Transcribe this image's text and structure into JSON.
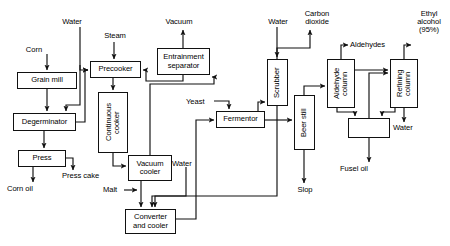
{
  "diagram": {
    "type": "process-flow-diagram",
    "canvas": {
      "width": 450,
      "height": 246
    },
    "colors": {
      "line": "#111111",
      "background": "#ffffff",
      "text": "#000000"
    }
  },
  "units": [
    {
      "id": "grain-mill",
      "label": "Grain mill",
      "orientation": "horizontal",
      "x": 17,
      "y": 72,
      "w": 60,
      "h": 17
    },
    {
      "id": "degerminator",
      "label": "Degerminator",
      "orientation": "horizontal",
      "x": 13,
      "y": 113,
      "w": 63,
      "h": 18
    },
    {
      "id": "press",
      "label": "Press",
      "orientation": "horizontal",
      "x": 18,
      "y": 150,
      "w": 48,
      "h": 17
    },
    {
      "id": "precooker",
      "label": "Precooker",
      "orientation": "horizontal",
      "x": 90,
      "y": 61,
      "w": 51,
      "h": 17
    },
    {
      "id": "continuous-cooker",
      "label": "Continuous\ncooker",
      "orientation": "vertical",
      "x": 98,
      "y": 92,
      "w": 30,
      "h": 61
    },
    {
      "id": "vacuum-cooler",
      "label": "Vacuum\ncooler",
      "orientation": "horizontal",
      "x": 128,
      "y": 155,
      "w": 44,
      "h": 26
    },
    {
      "id": "converter-and-cooler",
      "label": "Converter\nand cooler",
      "orientation": "horizontal",
      "x": 125,
      "y": 209,
      "w": 51,
      "h": 25
    },
    {
      "id": "entrainment-separator",
      "label": "Entrainment\nseparator",
      "orientation": "horizontal",
      "x": 157,
      "y": 48,
      "w": 53,
      "h": 27
    },
    {
      "id": "fermentor",
      "label": "Fermentor",
      "orientation": "horizontal",
      "x": 216,
      "y": 111,
      "w": 49,
      "h": 17
    },
    {
      "id": "scrubber",
      "label": "Scrubber",
      "orientation": "vertical",
      "x": 267,
      "y": 59,
      "w": 21,
      "h": 47
    },
    {
      "id": "beer-still",
      "label": "Beer still",
      "orientation": "vertical",
      "x": 294,
      "y": 95,
      "w": 21,
      "h": 55
    },
    {
      "id": "aldehyde-column",
      "label": "Aldehyde\ncolumn",
      "orientation": "vertical",
      "x": 327,
      "y": 59,
      "w": 28,
      "h": 49
    },
    {
      "id": "refining-column",
      "label": "Refining\ncolumn",
      "orientation": "vertical",
      "x": 390,
      "y": 59,
      "w": 28,
      "h": 49
    },
    {
      "id": "decanter",
      "label": "",
      "orientation": "horizontal",
      "x": 348,
      "y": 118,
      "w": 42,
      "h": 20
    }
  ],
  "stream_labels": [
    {
      "id": "corn",
      "text": "Corn",
      "x": 18,
      "y": 46,
      "align": "ctr",
      "w": 32
    },
    {
      "id": "water-top-left",
      "text": "Water",
      "x": 54,
      "y": 18,
      "align": "ctr",
      "w": 36
    },
    {
      "id": "steam",
      "text": "Steam",
      "x": 96,
      "y": 32,
      "align": "ctr",
      "w": 38
    },
    {
      "id": "press-cake",
      "text": "Press cake",
      "x": 62,
      "y": 172,
      "align": "lft",
      "w": 54
    },
    {
      "id": "corn-oil",
      "text": "Corn oil",
      "x": 7,
      "y": 185,
      "align": "lft",
      "w": 44
    },
    {
      "id": "vacuum",
      "text": "Vacuum",
      "x": 156,
      "y": 18,
      "align": "ctr",
      "w": 46
    },
    {
      "id": "yeast",
      "text": "Yeast",
      "x": 186,
      "y": 98,
      "align": "lft",
      "w": 30
    },
    {
      "id": "malt",
      "text": "Malt",
      "x": 103,
      "y": 186,
      "align": "lft",
      "w": 26
    },
    {
      "id": "water-mid",
      "text": "Water",
      "x": 172,
      "y": 160,
      "align": "lft",
      "w": 34
    },
    {
      "id": "water-scrubber",
      "text": "Water",
      "x": 261,
      "y": 18,
      "align": "ctr",
      "w": 34
    },
    {
      "id": "carbon-dioxide",
      "text": "Carbon\ndioxide",
      "x": 296,
      "y": 10,
      "align": "ctr",
      "w": 42
    },
    {
      "id": "slop",
      "text": "Slop",
      "x": 293,
      "y": 186,
      "align": "ctr",
      "w": 24
    },
    {
      "id": "aldehydes",
      "text": "Aldehydes",
      "x": 350,
      "y": 41,
      "align": "lft",
      "w": 52
    },
    {
      "id": "ethyl-alcohol",
      "text": "Ethyl\nalcohol\n(95%)",
      "x": 409,
      "y": 10,
      "align": "ctr",
      "w": 40
    },
    {
      "id": "water-refining",
      "text": "Water",
      "x": 393,
      "y": 124,
      "align": "lft",
      "w": 34
    },
    {
      "id": "fusel-oil",
      "text": "Fusel oil",
      "x": 340,
      "y": 165,
      "align": "lft",
      "w": 42
    }
  ],
  "connections": [
    {
      "id": "corn-to-grain-mill",
      "from": "corn",
      "to": "grain-mill"
    },
    {
      "id": "grain-mill-to-degerminator",
      "from": "grain-mill",
      "to": "degerminator"
    },
    {
      "id": "water-to-degerminator",
      "from": "water-top-left",
      "to": "degerminator"
    },
    {
      "id": "water-to-precooker",
      "from": "water-top-left",
      "to": "precooker"
    },
    {
      "id": "degerminator-to-press",
      "from": "degerminator",
      "to": "press"
    },
    {
      "id": "degerminator-to-precooker",
      "from": "degerminator",
      "to": "precooker"
    },
    {
      "id": "press-to-corn-oil",
      "from": "press",
      "to": "corn-oil"
    },
    {
      "id": "press-to-press-cake",
      "from": "press",
      "to": "press-cake"
    },
    {
      "id": "steam-to-precooker",
      "from": "steam",
      "to": "precooker"
    },
    {
      "id": "precooker-to-continuous-cooker",
      "from": "precooker",
      "to": "continuous-cooker"
    },
    {
      "id": "cooker-to-vacuum-cooler",
      "from": "continuous-cooker",
      "to": "vacuum-cooler"
    },
    {
      "id": "vacuum-cooler-to-separator",
      "from": "vacuum-cooler",
      "to": "entrainment-separator"
    },
    {
      "id": "separator-to-vacuum",
      "from": "entrainment-separator",
      "to": "vacuum"
    },
    {
      "id": "separator-to-precooker",
      "from": "entrainment-separator",
      "to": "precooker"
    },
    {
      "id": "vacuum-cooler-to-converter",
      "from": "vacuum-cooler",
      "to": "converter-and-cooler"
    },
    {
      "id": "malt-to-converter",
      "from": "malt",
      "to": "converter-and-cooler"
    },
    {
      "id": "water-to-converter",
      "from": "water-mid",
      "to": "converter-and-cooler"
    },
    {
      "id": "converter-to-fermentor",
      "from": "converter-and-cooler",
      "to": "fermentor"
    },
    {
      "id": "yeast-to-fermentor",
      "from": "yeast",
      "to": "fermentor"
    },
    {
      "id": "fermentor-to-scrubber",
      "from": "fermentor",
      "to": "scrubber"
    },
    {
      "id": "fermentor-to-beer-still",
      "from": "fermentor",
      "to": "beer-still"
    },
    {
      "id": "water-to-scrubber",
      "from": "water-scrubber",
      "to": "scrubber"
    },
    {
      "id": "scrubber-to-carbon-dioxide",
      "from": "scrubber",
      "to": "carbon-dioxide"
    },
    {
      "id": "scrubber-to-converter",
      "from": "scrubber",
      "to": "converter-and-cooler"
    },
    {
      "id": "beer-still-to-slop",
      "from": "beer-still",
      "to": "slop"
    },
    {
      "id": "beer-still-to-aldehyde-column",
      "from": "beer-still",
      "to": "aldehyde-column"
    },
    {
      "id": "aldehyde-to-aldehydes",
      "from": "aldehyde-column",
      "to": "aldehydes"
    },
    {
      "id": "aldehyde-to-refining-column",
      "from": "aldehyde-column",
      "to": "refining-column"
    },
    {
      "id": "aldehyde-to-decanter",
      "from": "aldehyde-column",
      "to": "decanter"
    },
    {
      "id": "refining-to-ethyl-alcohol",
      "from": "refining-column",
      "to": "ethyl-alcohol"
    },
    {
      "id": "refining-to-water",
      "from": "refining-column",
      "to": "water-refining"
    },
    {
      "id": "refining-to-decanter",
      "from": "refining-column",
      "to": "decanter"
    },
    {
      "id": "decanter-to-refining-column",
      "from": "decanter",
      "to": "refining-column"
    },
    {
      "id": "decanter-to-fusel-oil",
      "from": "decanter",
      "to": "fusel-oil"
    }
  ]
}
